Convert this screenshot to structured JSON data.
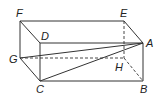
{
  "diagram": {
    "type": "rectangular prism (cuboid) with diagonals",
    "vertices": {
      "A": {
        "label": "A",
        "x": 143,
        "y": 43
      },
      "B": {
        "label": "B",
        "x": 143,
        "y": 81
      },
      "C": {
        "label": "C",
        "x": 40,
        "y": 81
      },
      "D": {
        "label": "D",
        "x": 40,
        "y": 43
      },
      "E": {
        "label": "E",
        "x": 124,
        "y": 21
      },
      "F": {
        "label": "F",
        "x": 20,
        "y": 21
      },
      "G": {
        "label": "G",
        "x": 20,
        "y": 58
      },
      "H": {
        "label": "H",
        "x": 124,
        "y": 58
      }
    },
    "solid_edges": [
      "F-E",
      "E-A",
      "F-D",
      "D-A",
      "F-G",
      "G-C",
      "D-C",
      "C-B",
      "A-B",
      "G-A",
      "C-A"
    ],
    "dashed_edges": [
      "E-H",
      "G-H",
      "H-B"
    ],
    "colors": {
      "stroke": "#333333",
      "label": "#222222",
      "background": "#ffffff"
    }
  }
}
